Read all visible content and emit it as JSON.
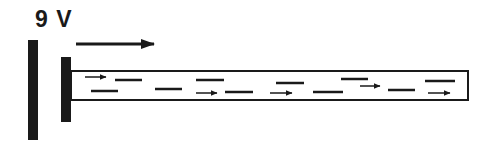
{
  "diagram": {
    "voltage_label": "9 V",
    "field_direction": "right",
    "colors": {
      "ink": "#1a1a1a",
      "background": "#ffffff"
    },
    "elements": {
      "left_plate": {
        "x": 28,
        "y": 40,
        "width": 10,
        "height": 100
      },
      "right_plate": {
        "x": 61,
        "y": 57,
        "width": 10,
        "height": 65
      },
      "field_arrow": {
        "x1": 76,
        "x2": 154,
        "y": 44
      },
      "tube": {
        "x": 71,
        "y": 71,
        "width": 397,
        "height": 29
      }
    },
    "dashes": [
      {
        "x1": 115,
        "x2": 142,
        "y": 80
      },
      {
        "x1": 91,
        "x2": 118,
        "y": 91
      },
      {
        "x1": 155,
        "x2": 182,
        "y": 89
      },
      {
        "x1": 196,
        "x2": 224,
        "y": 80
      },
      {
        "x1": 225,
        "x2": 253,
        "y": 92
      },
      {
        "x1": 276,
        "x2": 304,
        "y": 83
      },
      {
        "x1": 313,
        "x2": 343,
        "y": 92
      },
      {
        "x1": 341,
        "x2": 368,
        "y": 79
      },
      {
        "x1": 388,
        "x2": 415,
        "y": 90
      },
      {
        "x1": 425,
        "x2": 455,
        "y": 81
      }
    ],
    "small_arrows": [
      {
        "x1": 85,
        "x2": 106,
        "y": 77
      },
      {
        "x1": 196,
        "x2": 217,
        "y": 93
      },
      {
        "x1": 270,
        "x2": 292,
        "y": 93
      },
      {
        "x1": 360,
        "x2": 380,
        "y": 86
      },
      {
        "x1": 428,
        "x2": 450,
        "y": 93
      }
    ]
  }
}
